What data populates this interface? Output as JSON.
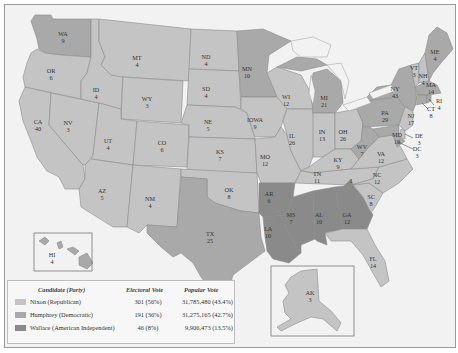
{
  "colors": {
    "nixon": "#c4c4c4",
    "humphrey": "#a9a9a9",
    "wallace": "#8a8a8a",
    "water": "#f2f2f2",
    "border": "#8c8c8c"
  },
  "states": {
    "WA": {
      "abbr": "WA",
      "ev": "9",
      "party": "humphrey"
    },
    "OR": {
      "abbr": "OR",
      "ev": "6",
      "party": "nixon"
    },
    "CA": {
      "abbr": "CA",
      "ev": "40",
      "party": "nixon"
    },
    "NV": {
      "abbr": "NV",
      "ev": "3",
      "party": "nixon"
    },
    "ID": {
      "abbr": "ID",
      "ev": "4",
      "party": "nixon"
    },
    "MT": {
      "abbr": "MT",
      "ev": "4",
      "party": "nixon"
    },
    "WY": {
      "abbr": "WY",
      "ev": "3",
      "party": "nixon"
    },
    "UT": {
      "abbr": "UT",
      "ev": "4",
      "party": "nixon"
    },
    "AZ": {
      "abbr": "AZ",
      "ev": "5",
      "party": "nixon"
    },
    "CO": {
      "abbr": "CO",
      "ev": "6",
      "party": "nixon"
    },
    "NM": {
      "abbr": "NM",
      "ev": "4",
      "party": "nixon"
    },
    "ND": {
      "abbr": "ND",
      "ev": "4",
      "party": "nixon"
    },
    "SD": {
      "abbr": "SD",
      "ev": "4",
      "party": "nixon"
    },
    "NE": {
      "abbr": "NE",
      "ev": "5",
      "party": "nixon"
    },
    "KS": {
      "abbr": "KS",
      "ev": "7",
      "party": "nixon"
    },
    "OK": {
      "abbr": "OK",
      "ev": "8",
      "party": "nixon"
    },
    "TX": {
      "abbr": "TX",
      "ev": "25",
      "party": "humphrey"
    },
    "MN": {
      "abbr": "MN",
      "ev": "10",
      "party": "humphrey"
    },
    "IOWA": {
      "abbr": "IOWA",
      "ev": "9",
      "party": "nixon"
    },
    "MO": {
      "abbr": "MO",
      "ev": "12",
      "party": "nixon"
    },
    "AR": {
      "abbr": "AR",
      "ev": "6",
      "party": "wallace"
    },
    "LA": {
      "abbr": "LA",
      "ev": "10",
      "party": "wallace"
    },
    "WI": {
      "abbr": "WI",
      "ev": "12",
      "party": "nixon"
    },
    "IL": {
      "abbr": "IL",
      "ev": "26",
      "party": "nixon"
    },
    "MI": {
      "abbr": "MI",
      "ev": "21",
      "party": "humphrey"
    },
    "IN": {
      "abbr": "IN",
      "ev": "13",
      "party": "nixon"
    },
    "OH": {
      "abbr": "OH",
      "ev": "26",
      "party": "nixon"
    },
    "KY": {
      "abbr": "KY",
      "ev": "9",
      "party": "nixon"
    },
    "TN": {
      "abbr": "TN",
      "ev": "11",
      "party": "nixon"
    },
    "MS": {
      "abbr": "MS",
      "ev": "7",
      "party": "wallace"
    },
    "AL": {
      "abbr": "AL",
      "ev": "10",
      "party": "wallace"
    },
    "GA": {
      "abbr": "GA",
      "ev": "12",
      "party": "wallace"
    },
    "FL": {
      "abbr": "FL",
      "ev": "14",
      "party": "nixon"
    },
    "SC": {
      "abbr": "SC",
      "ev": "8",
      "party": "nixon"
    },
    "NC": {
      "abbr": "NC",
      "ev": "12",
      "party": "nixon"
    },
    "NC_W": {
      "abbr": "1",
      "ev": "",
      "party": "wallace"
    },
    "VA": {
      "abbr": "VA",
      "ev": "12",
      "party": "nixon"
    },
    "WV": {
      "abbr": "WV",
      "ev": "7",
      "party": "humphrey"
    },
    "PA": {
      "abbr": "PA",
      "ev": "29",
      "party": "humphrey"
    },
    "NY": {
      "abbr": "NY",
      "ev": "43",
      "party": "humphrey"
    },
    "VT": {
      "abbr": "VT",
      "ev": "3",
      "party": "nixon"
    },
    "NH": {
      "abbr": "NH",
      "ev": "4",
      "party": "nixon"
    },
    "ME": {
      "abbr": "ME",
      "ev": "4",
      "party": "humphrey"
    },
    "MA": {
      "abbr": "MA",
      "ev": "14",
      "party": "humphrey"
    },
    "RI": {
      "abbr": "RI",
      "ev": "4",
      "party": "humphrey"
    },
    "CT": {
      "abbr": "CT",
      "ev": "8",
      "party": "humphrey"
    },
    "NJ": {
      "abbr": "NJ",
      "ev": "17",
      "party": "nixon"
    },
    "DE": {
      "abbr": "DE",
      "ev": "3",
      "party": "nixon"
    },
    "MD": {
      "abbr": "MD",
      "ev": "10",
      "party": "humphrey"
    },
    "DC": {
      "abbr": "DC",
      "ev": "3",
      "party": "humphrey"
    },
    "HI": {
      "abbr": "HI",
      "ev": "4",
      "party": "humphrey"
    },
    "AK": {
      "abbr": "AK",
      "ev": "3",
      "party": "nixon"
    }
  },
  "legend": {
    "headers": {
      "candidate": "Candidate (Party)",
      "electoral": "Electoral Vote",
      "popular": "Popular Vote"
    },
    "rows": [
      {
        "name": "Nixon (Republican)",
        "electoral": "301 (56%)",
        "popular": "31,785,480 (43.4%)",
        "party": "nixon"
      },
      {
        "name": "Humphrey (Democratic)",
        "electoral": "191 (36%)",
        "popular": "31,275,165 (42.7%)",
        "party": "humphrey"
      },
      {
        "name": "Wallace (American Independent)",
        "electoral": "46 (8%)",
        "popular": "9,906,473 (13.5%)",
        "party": "wallace"
      }
    ]
  }
}
